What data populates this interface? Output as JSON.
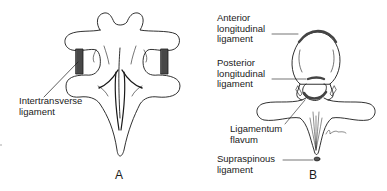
{
  "figure": {
    "panels": [
      {
        "id": "A",
        "label": "A",
        "callouts": [
          {
            "line1": "Intertransverse",
            "line2": "ligament"
          }
        ]
      },
      {
        "id": "B",
        "label": "B",
        "callouts": [
          {
            "line1": "Anterior",
            "line2": "longitudinal",
            "line3": "ligament"
          },
          {
            "line1": "Posterior",
            "line2": "longitudinal",
            "line3": "ligament"
          },
          {
            "line1": "Ligamentum",
            "line2": "flavum"
          },
          {
            "line1": "Supraspinous",
            "line2": "ligament"
          }
        ]
      }
    ],
    "colors": {
      "ink": "#1a1a1a",
      "background": "#ffffff",
      "ligament_fill": "#555555"
    }
  }
}
